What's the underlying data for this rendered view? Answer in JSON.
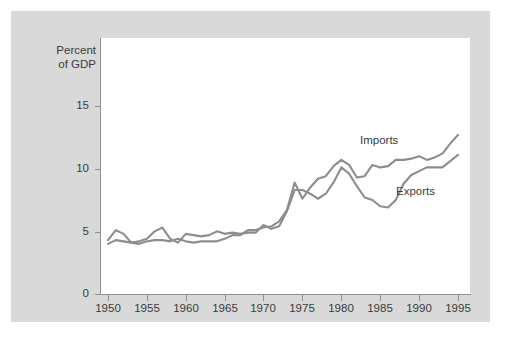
{
  "chart_data": {
    "type": "line",
    "title": "",
    "xlabel": "",
    "ylabel": "Percent of GDP",
    "ylabel_lines": [
      "Percent",
      "of GDP"
    ],
    "xlim": [
      1950,
      1995
    ],
    "ylim": [
      0,
      16.5
    ],
    "grid": false,
    "legend_position": "inline-annotations",
    "y_ticks": [
      0,
      5,
      10,
      15
    ],
    "y_tick_labels": [
      "0",
      "5",
      "10",
      "15"
    ],
    "x_ticks": [
      1950,
      1955,
      1960,
      1965,
      1970,
      1975,
      1980,
      1985,
      1990,
      1995
    ],
    "x_tick_labels": [
      "1950",
      "1955",
      "1960",
      "1965",
      "1970",
      "1975",
      "1980",
      "1985",
      "1990",
      "1995"
    ],
    "x": [
      1950,
      1951,
      1952,
      1953,
      1954,
      1955,
      1956,
      1957,
      1958,
      1959,
      1960,
      1961,
      1962,
      1963,
      1964,
      1965,
      1966,
      1967,
      1968,
      1969,
      1970,
      1971,
      1972,
      1973,
      1974,
      1975,
      1976,
      1977,
      1978,
      1979,
      1980,
      1981,
      1982,
      1983,
      1984,
      1985,
      1986,
      1987,
      1988,
      1989,
      1990,
      1991,
      1992,
      1993,
      1994,
      1995
    ],
    "series": [
      {
        "name": "Imports",
        "color": "#8d8d8d",
        "values": [
          4.0,
          4.3,
          4.2,
          4.1,
          4.0,
          4.2,
          4.3,
          4.3,
          4.2,
          4.4,
          4.2,
          4.1,
          4.2,
          4.2,
          4.2,
          4.4,
          4.7,
          4.7,
          5.1,
          5.1,
          5.3,
          5.4,
          5.8,
          6.7,
          8.9,
          7.6,
          8.5,
          9.2,
          9.4,
          10.2,
          10.7,
          10.3,
          9.3,
          9.4,
          10.3,
          10.1,
          10.2,
          10.7,
          10.7,
          10.8,
          11.0,
          10.7,
          10.9,
          11.2,
          12.0,
          12.7
        ]
      },
      {
        "name": "Exports",
        "color": "#8d8d8d",
        "values": [
          4.3,
          5.1,
          4.8,
          4.1,
          4.2,
          4.4,
          5.0,
          5.3,
          4.4,
          4.1,
          4.8,
          4.7,
          4.6,
          4.7,
          5.0,
          4.8,
          4.9,
          4.8,
          4.9,
          4.9,
          5.5,
          5.2,
          5.4,
          6.6,
          8.3,
          8.3,
          8.0,
          7.6,
          8.0,
          8.9,
          10.1,
          9.6,
          8.6,
          7.7,
          7.5,
          7.0,
          6.9,
          7.5,
          8.8,
          9.5,
          9.8,
          10.1,
          10.1,
          10.1,
          10.6,
          11.1
        ]
      }
    ]
  }
}
